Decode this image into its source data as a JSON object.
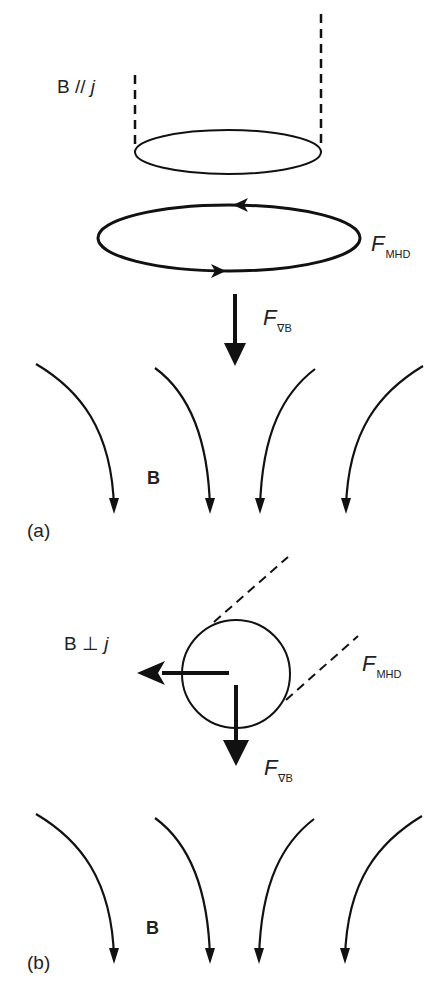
{
  "figure": {
    "panels": [
      {
        "id": "a",
        "panel_label": "(a)",
        "orientation_label": {
          "prefix": "B // ",
          "var": "j"
        },
        "force_mhd": {
          "symbol": "F",
          "subscript": "MHD"
        },
        "force_gradb": {
          "symbol": "F",
          "subscript": "∇B"
        },
        "field_label": "B"
      },
      {
        "id": "b",
        "panel_label": "(b)",
        "orientation_label": {
          "prefix": "B ⊥ ",
          "var": "j"
        },
        "force_mhd": {
          "symbol": "F",
          "subscript": "MHD"
        },
        "force_gradb": {
          "symbol": "F",
          "subscript": "∇B"
        },
        "field_label": "B"
      }
    ],
    "colors": {
      "stroke": "#111111",
      "background": "#ffffff"
    }
  }
}
